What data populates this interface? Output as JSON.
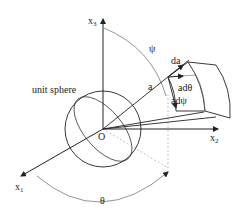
{
  "diagram": {
    "labels": {
      "x1": "x",
      "x1_sub": "1",
      "x2": "x",
      "x2_sub": "2",
      "x3": "x",
      "x3_sub": "3",
      "origin": "O",
      "unit_sphere": "unit sphere",
      "theta": "θ",
      "psi": "ψ",
      "a": "a",
      "da": "da",
      "a_dtheta": "adθ",
      "a_dpsi": "adψ"
    },
    "colors": {
      "stroke": "#222222",
      "thin": "#555555",
      "dotted": "#aaaaaa",
      "background": "#ffffff"
    }
  }
}
